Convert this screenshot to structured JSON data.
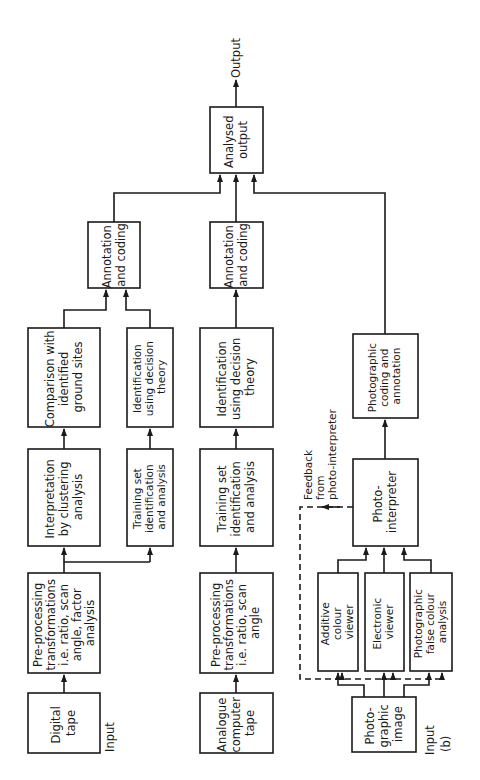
{
  "diagram": {
    "orientation": "rotated-90-ccw",
    "output_label": "Output",
    "figure_label": "(b)",
    "feedback_label": [
      "Feedback",
      "from",
      "photo-interpreter"
    ],
    "input_labels": {
      "digital": "Input",
      "photographic": "Input"
    },
    "nodes": {
      "digital_tape": [
        "Digital",
        "tape"
      ],
      "preproc_digital": [
        "Pre-processing",
        "transformations",
        "i.e. ratio, scan",
        "angle, factor",
        "analysis"
      ],
      "interpretation_clustering": [
        "Interpretation",
        "by clustering",
        "analysis"
      ],
      "training_set_1": [
        "Training set",
        "identification",
        "and analysis"
      ],
      "comparison_ground": [
        "Comparison with",
        "identified",
        "ground sites"
      ],
      "identification_1": [
        "Identification",
        "using decision",
        "theory"
      ],
      "annotation_1": [
        "Annotation",
        "and coding"
      ],
      "analogue_tape": [
        "Analogue",
        "computer",
        "tape"
      ],
      "preproc_analogue": [
        "Pre-processing",
        "transformations",
        "i.e. ratio, scan",
        "angle"
      ],
      "training_set_2": [
        "Training set",
        "identification",
        "and analysis"
      ],
      "identification_2": [
        "Identification",
        "using decision",
        "theory"
      ],
      "annotation_2": [
        "Annotation",
        "and coding"
      ],
      "analysed_output": [
        "Analysed",
        "output"
      ],
      "photographic_image": [
        "Photo-",
        "graphic",
        "image"
      ],
      "additive_viewer": [
        "Additive",
        "colour",
        "viewer"
      ],
      "electronic_viewer": [
        "Electronic",
        "viewer"
      ],
      "false_colour": [
        "Photographic",
        "false colour",
        "analysis"
      ],
      "photo_interpreter": [
        "Photo-",
        "interpreter"
      ],
      "photo_coding": [
        "Photographic",
        "coding and",
        "annotation"
      ]
    }
  }
}
